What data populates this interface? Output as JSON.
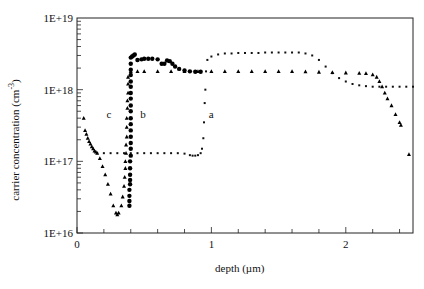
{
  "chart_data": {
    "type": "scatter",
    "title": "",
    "xlabel": "depth (µm)",
    "ylabel": "carrier concentration (cm^-3)",
    "ylabel_main": "carrier concentration (cm",
    "ylabel_exp": "-3",
    "ylabel_close": ")",
    "xlim": [
      0,
      2.5
    ],
    "ylim": [
      1e+16,
      1e+19
    ],
    "yscale": "log",
    "grid": false,
    "legend": "none (curves labeled inline)",
    "x_ticks": [
      {
        "value": 0,
        "label": "0"
      },
      {
        "value": 1,
        "label": "1"
      },
      {
        "value": 2,
        "label": "2"
      }
    ],
    "x_minor_step": 0.2,
    "y_ticks": [
      {
        "value": 1e+16,
        "label": "1E+16"
      },
      {
        "value": 1e+17,
        "label": "1E+17"
      },
      {
        "value": 1e+18,
        "label": "1E+18"
      },
      {
        "value": 1e+19,
        "label": "1E+19"
      }
    ],
    "annotations": [
      {
        "text": "a",
        "x": 0.98,
        "y": 4e+17
      },
      {
        "text": "b",
        "x": 0.47,
        "y": 4e+17
      },
      {
        "text": "c",
        "x": 0.22,
        "y": 4e+17
      }
    ],
    "series": [
      {
        "name": "a",
        "marker": "small-dot",
        "x": [
          0.15,
          0.2,
          0.25,
          0.3,
          0.35,
          0.4,
          0.45,
          0.5,
          0.55,
          0.6,
          0.65,
          0.7,
          0.75,
          0.8,
          0.84,
          0.86,
          0.88,
          0.9,
          0.92,
          0.93,
          0.94,
          0.945,
          0.95,
          0.955,
          0.96,
          0.97,
          1.0,
          1.05,
          1.1,
          1.15,
          1.2,
          1.25,
          1.3,
          1.35,
          1.4,
          1.45,
          1.5,
          1.55,
          1.6,
          1.65,
          1.7,
          1.75,
          1.8,
          1.85,
          1.9,
          1.95,
          2.0,
          2.05,
          2.1,
          2.15,
          2.2,
          2.25,
          2.3,
          2.35,
          2.4,
          2.45,
          2.5
        ],
        "y": [
          1.3e+17,
          1.3e+17,
          1.3e+17,
          1.3e+17,
          1.3e+17,
          1.3e+17,
          1.3e+17,
          1.3e+17,
          1.3e+17,
          1.3e+17,
          1.3e+17,
          1.3e+17,
          1.3e+17,
          1.28e+17,
          1.22e+17,
          1.2e+17,
          1.2e+17,
          1.22e+17,
          1.3e+17,
          1.5e+17,
          2.1e+17,
          3.5e+17,
          6.5e+17,
          1e+18,
          1.8e+18,
          2.6e+18,
          2.9e+18,
          3.1e+18,
          3.2e+18,
          3.2e+18,
          3.25e+18,
          3.25e+18,
          3.25e+18,
          3.25e+18,
          3.3e+18,
          3.3e+18,
          3.3e+18,
          3.3e+18,
          3.3e+18,
          3.3e+18,
          3.2e+18,
          3e+18,
          2.6e+18,
          2.1e+18,
          1.7e+18,
          1.45e+18,
          1.3e+18,
          1.2e+18,
          1.15e+18,
          1.12e+18,
          1.1e+18,
          1.1e+18,
          1.1e+18,
          1.1e+18,
          1.1e+18,
          1.1e+18,
          1.1e+18
        ]
      },
      {
        "name": "b",
        "marker": "filled-circle",
        "x": [
          0.39,
          0.39,
          0.39,
          0.39,
          0.395,
          0.395,
          0.395,
          0.395,
          0.395,
          0.4,
          0.4,
          0.4,
          0.4,
          0.4,
          0.4,
          0.4,
          0.4,
          0.4,
          0.4,
          0.4,
          0.4,
          0.4,
          0.4,
          0.4,
          0.4,
          0.4,
          0.41,
          0.42,
          0.43,
          0.45,
          0.48,
          0.5,
          0.53,
          0.56,
          0.6,
          0.63,
          0.65,
          0.67,
          0.69,
          0.71,
          0.73,
          0.76,
          0.8,
          0.84,
          0.88,
          0.92
        ],
        "y": [
          2.4e+16,
          2.8e+16,
          3.3e+16,
          4e+16,
          4.8e+16,
          5.5e+16,
          6.5e+16,
          8e+16,
          1e+17,
          1.2e+17,
          1.5e+17,
          1.8e+17,
          2.2e+17,
          2.7e+17,
          3.3e+17,
          4e+17,
          5e+17,
          6e+17,
          7.5e+17,
          9e+17,
          1.1e+18,
          1.3e+18,
          1.6e+18,
          1.9e+18,
          2.3e+18,
          2.8e+18,
          2.9e+18,
          3e+18,
          3.1e+18,
          2.6e+18,
          2.65e+18,
          2.7e+18,
          2.7e+18,
          2.7e+18,
          2.65e+18,
          2.3e+18,
          2.3e+18,
          2.55e+18,
          2.5e+18,
          2.3e+18,
          2.1e+18,
          1.95e+18,
          1.85e+18,
          1.8e+18,
          1.78e+18,
          1.78e+18
        ]
      },
      {
        "name": "c",
        "marker": "triangle",
        "x": [
          0.05,
          0.06,
          0.07,
          0.08,
          0.09,
          0.1,
          0.11,
          0.12,
          0.13,
          0.14,
          0.15,
          0.17,
          0.19,
          0.21,
          0.23,
          0.25,
          0.27,
          0.29,
          0.3,
          0.31,
          0.33,
          0.34,
          0.35,
          0.355,
          0.36,
          0.36,
          0.365,
          0.365,
          0.37,
          0.37,
          0.37,
          0.375,
          0.375,
          0.38,
          0.38,
          0.38,
          0.4,
          0.45,
          0.5,
          0.6,
          0.7,
          0.8,
          0.9,
          1.0,
          1.1,
          1.2,
          1.3,
          1.4,
          1.5,
          1.6,
          1.7,
          1.8,
          1.9,
          2.0,
          2.1,
          2.15,
          2.2,
          2.23,
          2.25,
          2.27,
          2.29,
          2.31,
          2.34,
          2.37,
          2.4,
          2.41,
          2.47
        ],
        "y": [
          4e+17,
          2.7e+17,
          2.4e+17,
          2.1e+17,
          1.9e+17,
          1.75e+17,
          1.6e+17,
          1.5e+17,
          1.4e+17,
          1.35e+17,
          1.3e+17,
          1.1e+17,
          8.5e+16,
          6.5e+16,
          4.8e+16,
          3.5e+16,
          2.4e+16,
          1.9e+16,
          1.8e+16,
          1.9e+16,
          2.4e+16,
          3.2e+16,
          4.5e+16,
          6e+16,
          8e+16,
          1e+17,
          1.3e+17,
          1.7e+17,
          2.2e+17,
          3e+17,
          4e+17,
          5.5e+17,
          7e+17,
          9e+17,
          1.2e+18,
          1.5e+18,
          1.8e+18,
          1.8e+18,
          1.8e+18,
          1.8e+18,
          1.8e+18,
          1.8e+18,
          1.8e+18,
          1.8e+18,
          1.8e+18,
          1.8e+18,
          1.8e+18,
          1.8e+18,
          1.8e+18,
          1.8e+18,
          1.78e+18,
          1.76e+18,
          1.74e+18,
          1.72e+18,
          1.7e+18,
          1.68e+18,
          1.62e+18,
          1.5e+18,
          1.3e+18,
          1.1e+18,
          9e+17,
          7.5e+17,
          6e+17,
          4.5e+17,
          3.5e+17,
          3.2e+17,
          1.25e+17
        ]
      }
    ]
  }
}
